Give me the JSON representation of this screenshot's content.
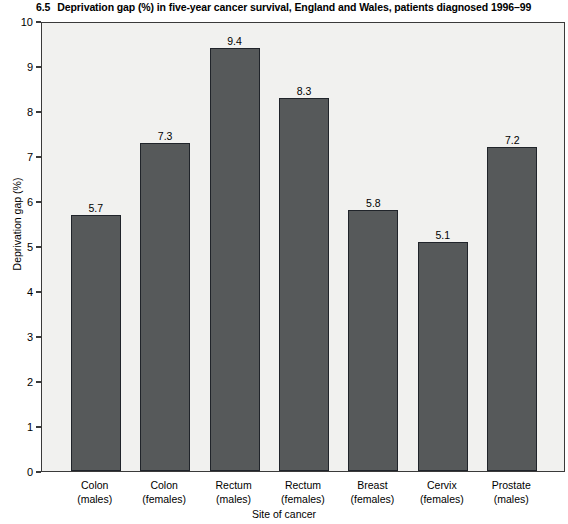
{
  "chart_data": {
    "type": "bar",
    "title_number": "6.5",
    "title_text": "Deprivation gap (%) in five-year cancer survival, England and Wales, patients diagnosed 1996–99",
    "categories": [
      "Colon (males)",
      "Colon (females)",
      "Rectum (males)",
      "Rectum (females)",
      "Breast (females)",
      "Cervix (females)",
      "Prostate (males)"
    ],
    "category_lines": [
      [
        "Colon",
        "(males)"
      ],
      [
        "Colon",
        "(females)"
      ],
      [
        "Rectum",
        "(males)"
      ],
      [
        "Rectum",
        "(females)"
      ],
      [
        "Breast",
        "(females)"
      ],
      [
        "Cervix",
        "(females)"
      ],
      [
        "Prostate",
        "(males)"
      ]
    ],
    "values": [
      5.7,
      7.3,
      9.4,
      8.3,
      5.8,
      5.1,
      7.2
    ],
    "value_labels": [
      "5.7",
      "7.3",
      "9.4",
      "8.3",
      "5.8",
      "5.1",
      "7.2"
    ],
    "xlabel": "Site of cancer",
    "ylabel": "Deprivation gap (%)",
    "ylim": [
      0,
      10
    ],
    "ytick_labels": [
      "0",
      "1",
      "2",
      "3",
      "4",
      "5",
      "6",
      "7",
      "8",
      "9",
      "10"
    ],
    "ytick_values": [
      0,
      1,
      2,
      3,
      4,
      5,
      6,
      7,
      8,
      9,
      10
    ],
    "grid": false,
    "legend": null,
    "bar_color": "#56595a",
    "bar_edge_color": "#20242a",
    "plot_background": "#f1f1ef",
    "axis_color": "#3a3a3a",
    "text_color": "#000000"
  }
}
